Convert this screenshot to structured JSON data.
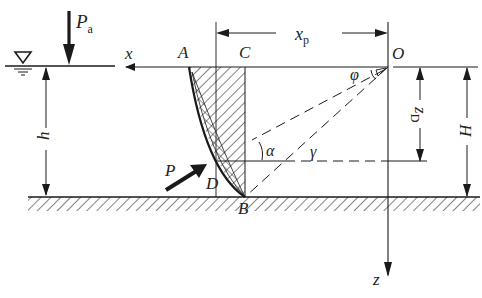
{
  "diagram": {
    "labels": {
      "Pa": "P",
      "Pa_sub": "a",
      "x": "x",
      "A": "A",
      "C": "C",
      "xp": "x",
      "xp_sub": "p",
      "O": "O",
      "phi": "φ",
      "zD": "z",
      "zD_sub": "D",
      "H": "H",
      "h": "h",
      "alpha": "α",
      "gamma": "γ",
      "P": "P",
      "D": "D",
      "B": "B",
      "z": "z"
    },
    "colors": {
      "line": "#1a1a1a",
      "background": "#ffffff"
    }
  }
}
